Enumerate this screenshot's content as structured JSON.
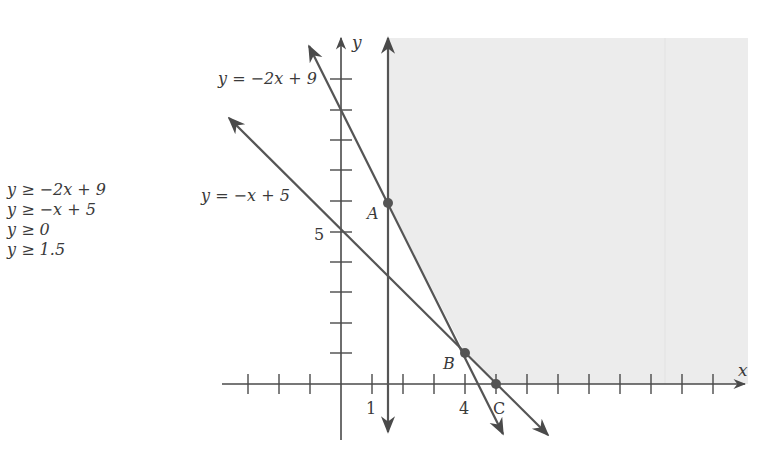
{
  "inequalities": [
    "y ≥ −2x + 9",
    "y ≥ −x + 5",
    "y ≥ 0",
    "y ≥ 1.5"
  ],
  "axes": {
    "x_label": "x",
    "y_label": "y"
  },
  "tick_labels": {
    "x_1": "1",
    "x_4": "4",
    "y_5": "5"
  },
  "line_labels": {
    "line1": "y = −2x + 9",
    "line2": "y = −x + 5"
  },
  "points": {
    "A": "A",
    "B": "B",
    "C": "C"
  },
  "colors": {
    "line": "#555555",
    "shade": "#ececec",
    "text": "#3a3a3a"
  }
}
